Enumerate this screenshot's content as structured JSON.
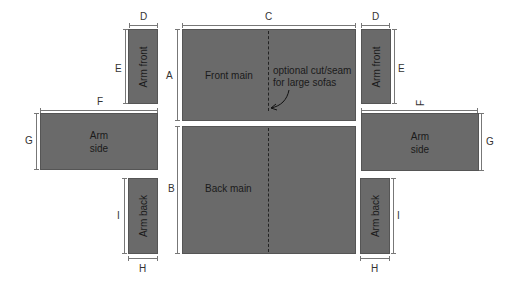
{
  "panels": {
    "front_main": "Front main",
    "back_main": "Back main",
    "arm_front_left": "Arm front",
    "arm_front_right": "Arm front",
    "arm_side_left_1": "Arm",
    "arm_side_left_2": "side",
    "arm_side_right_1": "Arm",
    "arm_side_right_2": "side",
    "arm_back_left": "Arm back",
    "arm_back_right": "Arm back"
  },
  "annotation": {
    "line1": "optional cut/seam",
    "line2": "for large sofas"
  },
  "dimensions": {
    "A": "A",
    "B": "B",
    "C": "C",
    "D": "D",
    "E": "E",
    "F": "F",
    "G": "G",
    "H": "H",
    "I": "I"
  },
  "colors": {
    "panel_fill": "#6a6a6a",
    "background": "#ffffff"
  }
}
